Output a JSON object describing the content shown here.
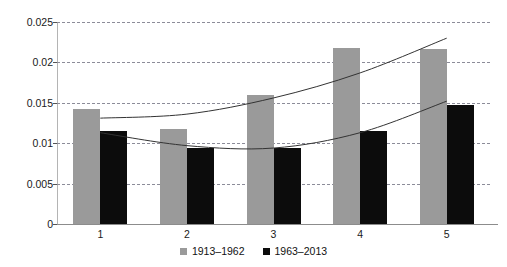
{
  "chart_data": {
    "type": "bar",
    "title": "",
    "subtitle": "",
    "xlabel": "",
    "ylabel": "",
    "categories": [
      "1",
      "2",
      "3",
      "4",
      "5"
    ],
    "ylim": [
      0,
      0.025
    ],
    "ytick_labels": [
      "0",
      "0.005",
      "0.01",
      "0.015",
      "0.02",
      "0.025"
    ],
    "ytick_values": [
      0,
      0.005,
      0.01,
      0.015,
      0.02,
      0.025
    ],
    "grid": true,
    "grid_axis": "y",
    "grid_style": "dashed",
    "legend_position": "bottom-center",
    "series": [
      {
        "name": "1913–1962",
        "color": "#9a9a9a",
        "values": [
          0.0142,
          0.0117,
          0.016,
          0.0218,
          0.0216
        ]
      },
      {
        "name": "1963–2013",
        "color": "#0c0c0c",
        "values": [
          0.0115,
          0.0094,
          0.0094,
          0.0115,
          0.0147
        ]
      }
    ],
    "trendlines": [
      {
        "name": "1913–1962 trend",
        "series": "1913–1962",
        "color": "#333333",
        "shape": "polynomial",
        "points": [
          [
            1,
            0.0131
          ],
          [
            2,
            0.0136
          ],
          [
            3,
            0.0156
          ],
          [
            4,
            0.0187
          ],
          [
            5,
            0.023
          ]
        ]
      },
      {
        "name": "1963–2013 trend",
        "series": "1963–2013",
        "color": "#333333",
        "shape": "polynomial",
        "points": [
          [
            1,
            0.0113
          ],
          [
            2,
            0.0097
          ],
          [
            3,
            0.0094
          ],
          [
            4,
            0.0113
          ],
          [
            5,
            0.0152
          ]
        ]
      }
    ]
  },
  "legend": {
    "items": [
      {
        "label": "1913–1962",
        "color": "#9a9a9a"
      },
      {
        "label": "1963–2013",
        "color": "#0c0c0c"
      }
    ]
  },
  "colors": {
    "series_1": "#9a9a9a",
    "series_2": "#0c0c0c",
    "gridline": "#8c8c99",
    "axis": "#8c8c8c",
    "trend": "#333333",
    "background": "#ffffff",
    "text": "#1a1a1a"
  }
}
